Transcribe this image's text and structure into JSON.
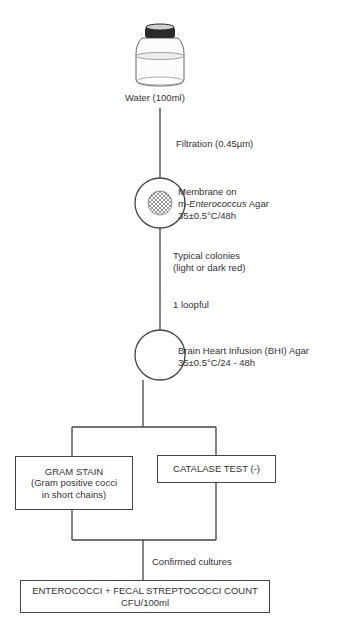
{
  "diagram": {
    "type": "flowchart",
    "steps": {
      "sample": {
        "label": "Water (100ml)",
        "icon": "water-bottle-icon"
      },
      "filtration": {
        "label": "Filtration (0.45µm)"
      },
      "membrane": {
        "icon": "membrane-filter-icon",
        "line1": "Membrane on",
        "line2_prefix": "m-",
        "line2_italic": "Enterococcus",
        "line2_suffix": " Agar",
        "line3": "35±0.5°C/48h"
      },
      "colonies": {
        "line1": "Typical colonies",
        "line2": "(light or dark red)"
      },
      "loopful": {
        "label": "1 loopful"
      },
      "bhi": {
        "icon": "petri-dish-icon",
        "line1": "Brain Heart Infusion (BHI) Agar",
        "line2": "35±0.5°C/24 - 48h"
      },
      "gram_stain": {
        "line1": "GRAM STAIN",
        "line2": "(Gram positive cocci",
        "line3": "in short chains)"
      },
      "catalase": {
        "label": "CATALASE TEST (-)"
      },
      "confirmed": {
        "label": "Confirmed cultures"
      },
      "result": {
        "line1": "ENTEROCOCCI + FECAL STREPTOCOCCI COUNT",
        "line2": "CFU/100ml"
      }
    },
    "colors": {
      "line": "#444444",
      "text": "#333333",
      "bottle_cap": "#2b2b2b",
      "background": "#ffffff"
    }
  }
}
